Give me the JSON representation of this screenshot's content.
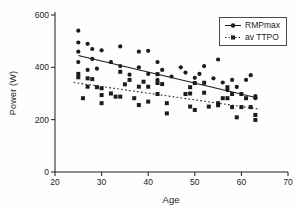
{
  "figure": {
    "background": "#fefefe",
    "ink_color": "#1c1c1c"
  },
  "chart_data": {
    "type": "scatter",
    "title": "",
    "xlabel": "Age",
    "ylabel": "Power (W)",
    "xlim": [
      20,
      70
    ],
    "ylim": [
      0,
      600
    ],
    "x_ticks": [
      20,
      30,
      40,
      50,
      60,
      70
    ],
    "y_ticks": [
      0,
      200,
      400,
      600
    ],
    "grid": false,
    "legend_position": "top-right",
    "series": [
      {
        "name": "RMPmax",
        "marker": "circle",
        "line_style": "solid",
        "trendline": {
          "x": [
            25,
            63.5
          ],
          "y": [
            445,
            283
          ]
        },
        "points": [
          [
            25,
            540
          ],
          [
            25,
            495
          ],
          [
            25,
            460
          ],
          [
            25,
            420
          ],
          [
            27,
            490
          ],
          [
            28,
            470
          ],
          [
            28,
            432
          ],
          [
            27,
            390
          ],
          [
            29,
            395
          ],
          [
            30,
            465
          ],
          [
            32,
            420
          ],
          [
            34,
            480
          ],
          [
            34,
            405
          ],
          [
            36,
            372
          ],
          [
            38,
            460
          ],
          [
            38,
            400
          ],
          [
            40,
            463
          ],
          [
            40,
            375
          ],
          [
            42,
            420
          ],
          [
            43,
            390
          ],
          [
            42,
            352
          ],
          [
            45,
            365
          ],
          [
            47,
            400
          ],
          [
            48,
            380
          ],
          [
            50,
            360
          ],
          [
            51,
            375
          ],
          [
            52,
            405
          ],
          [
            55,
            430
          ],
          [
            54,
            358
          ],
          [
            56,
            342
          ],
          [
            57,
            313
          ],
          [
            58,
            352
          ],
          [
            59,
            325
          ],
          [
            61,
            352
          ],
          [
            62,
            370
          ],
          [
            63,
            290
          ],
          [
            63,
            282
          ]
        ]
      },
      {
        "name": "av TTPO",
        "marker": "square",
        "line_style": "dotted",
        "trendline": {
          "x": [
            24,
            64
          ],
          "y": [
            342,
            240
          ]
        },
        "points": [
          [
            25,
            375
          ],
          [
            25,
            362
          ],
          [
            26,
            282
          ],
          [
            27,
            358
          ],
          [
            28,
            355
          ],
          [
            27,
            326
          ],
          [
            29,
            324
          ],
          [
            30,
            320
          ],
          [
            30,
            294
          ],
          [
            30,
            263
          ],
          [
            32,
            300
          ],
          [
            33,
            288
          ],
          [
            34,
            383
          ],
          [
            35,
            335
          ],
          [
            34,
            288
          ],
          [
            36,
            352
          ],
          [
            37,
            282
          ],
          [
            38,
            326
          ],
          [
            38,
            256
          ],
          [
            39,
            345
          ],
          [
            40,
            326
          ],
          [
            40,
            269
          ],
          [
            42,
            374
          ],
          [
            42,
            340
          ],
          [
            42,
            298
          ],
          [
            43,
            336
          ],
          [
            44,
            263
          ],
          [
            44,
            224
          ],
          [
            48,
            298
          ],
          [
            49,
            324
          ],
          [
            49,
            300
          ],
          [
            49,
            250
          ],
          [
            50,
            237
          ],
          [
            50,
            340
          ],
          [
            52,
            341
          ],
          [
            52,
            303
          ],
          [
            53,
            250
          ],
          [
            55,
            263
          ],
          [
            55,
            255
          ],
          [
            56,
            282
          ],
          [
            57,
            282
          ],
          [
            57,
            324
          ],
          [
            58,
            298
          ],
          [
            58,
            248
          ],
          [
            59,
            209
          ],
          [
            60,
            298
          ],
          [
            60,
            248
          ],
          [
            61,
            282
          ],
          [
            62,
            248
          ],
          [
            63,
            218
          ],
          [
            63,
            199
          ]
        ]
      }
    ]
  }
}
